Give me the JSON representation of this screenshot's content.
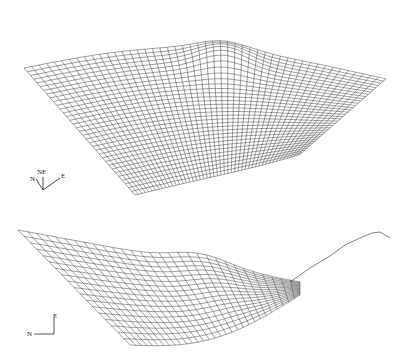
{
  "figure": {
    "panels": [
      {
        "id": "top",
        "description": "3D wireframe terrain surface, oblique view",
        "compass": {
          "labels": [
            "N",
            "NE",
            "E"
          ]
        }
      },
      {
        "id": "bottom",
        "description": "3D wireframe terrain surface, side view (valley profile)",
        "compass": {
          "labels": [
            "N",
            "E"
          ]
        }
      }
    ],
    "colors": {
      "mesh": "#2a2a2a",
      "background": "#ffffff"
    }
  }
}
